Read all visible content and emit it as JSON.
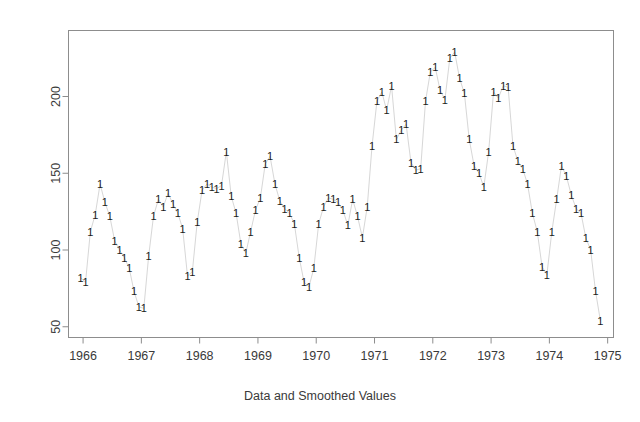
{
  "chart_data": {
    "type": "line",
    "title": "",
    "subtitle": "",
    "xlabel": "Data and Smoothed Values",
    "ylabel": "",
    "xlim": [
      1965.75,
      1975.1
    ],
    "ylim": [
      43,
      243
    ],
    "xticks": [
      1966,
      1967,
      1968,
      1969,
      1970,
      1971,
      1972,
      1973,
      1974,
      1975
    ],
    "xticklabels": [
      "1966",
      "1967",
      "1968",
      "1969",
      "1970",
      "1971",
      "1972",
      "1973",
      "1974",
      "1975"
    ],
    "yticks": [
      50,
      100,
      150,
      200
    ],
    "yticklabels": [
      "50",
      "100",
      "150",
      "200"
    ],
    "grid": false,
    "legend": false,
    "point_marker": "1",
    "marker_color": "#1c1c1c",
    "line_color": "#d7d7d7",
    "frame_color": "#8d8d8d",
    "series": [
      {
        "name": "Data and Smoothed Values",
        "x": [
          1965.958,
          1966.042,
          1966.125,
          1966.208,
          1966.292,
          1966.375,
          1966.458,
          1966.542,
          1966.625,
          1966.708,
          1966.792,
          1966.875,
          1966.958,
          1967.042,
          1967.125,
          1967.208,
          1967.292,
          1967.375,
          1967.458,
          1967.542,
          1967.625,
          1967.708,
          1967.792,
          1967.875,
          1967.958,
          1968.042,
          1968.125,
          1968.208,
          1968.292,
          1968.375,
          1968.458,
          1968.542,
          1968.625,
          1968.708,
          1968.792,
          1968.875,
          1968.958,
          1969.042,
          1969.125,
          1969.208,
          1969.292,
          1969.375,
          1969.458,
          1969.542,
          1969.625,
          1969.708,
          1969.792,
          1969.875,
          1969.958,
          1970.042,
          1970.125,
          1970.208,
          1970.292,
          1970.375,
          1970.458,
          1970.542,
          1970.625,
          1970.708,
          1970.792,
          1970.875,
          1970.958,
          1971.042,
          1971.125,
          1971.208,
          1971.292,
          1971.375,
          1971.458,
          1971.542,
          1971.625,
          1971.708,
          1971.792,
          1971.875,
          1971.958,
          1972.042,
          1972.125,
          1972.208,
          1972.292,
          1972.375,
          1972.458,
          1972.542,
          1972.625,
          1972.708,
          1972.792,
          1972.875,
          1972.958,
          1973.042,
          1973.125,
          1973.208,
          1973.292,
          1973.375,
          1973.458,
          1973.542,
          1973.625,
          1973.708,
          1973.792,
          1973.875,
          1973.958,
          1974.042,
          1974.125,
          1974.208,
          1974.292,
          1974.375,
          1974.458,
          1974.542,
          1974.625,
          1974.708,
          1974.792,
          1974.875
        ],
        "values": [
          82,
          79,
          112,
          123,
          143,
          131,
          122,
          106,
          100,
          95,
          88,
          73,
          63,
          62,
          96,
          122,
          133,
          128,
          137,
          130,
          124,
          114,
          83,
          86,
          118,
          139,
          143,
          141,
          140,
          142,
          164,
          135,
          124,
          104,
          98,
          112,
          126,
          134,
          156,
          161,
          143,
          132,
          127,
          124,
          117,
          95,
          79,
          76,
          88,
          117,
          128,
          134,
          133,
          131,
          126,
          116,
          133,
          122,
          108,
          128,
          168,
          197,
          203,
          191,
          207,
          172,
          178,
          182,
          157,
          152,
          153,
          197,
          216,
          219,
          204,
          198,
          225,
          229,
          212,
          202,
          172,
          155,
          150,
          141,
          164,
          203,
          199,
          207,
          206,
          168,
          158,
          153,
          143,
          124,
          112,
          89,
          84,
          112,
          133,
          155,
          148,
          136,
          127,
          124,
          108,
          100,
          73,
          54
        ]
      }
    ]
  },
  "axes": {
    "x_caption": "Data and Smoothed Values"
  }
}
